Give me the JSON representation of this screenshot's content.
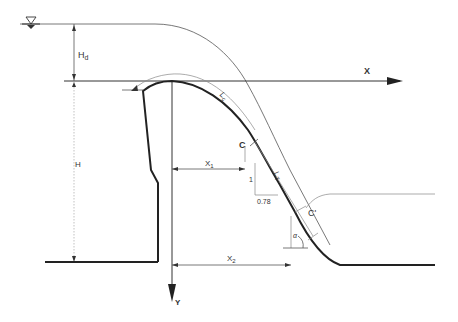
{
  "diagram": {
    "labels": {
      "x_axis": "X",
      "y_axis": "Y",
      "design_head": "H",
      "design_head_sub": "d",
      "dam_height": "H",
      "curved_length": "L",
      "curved_length_sub": "c",
      "straight_length": "L",
      "straight_length_sub": "T",
      "tangent_point": "C",
      "end_point": "C'",
      "x1": "X",
      "x1_sub": "1",
      "x2": "X",
      "x2_sub": "2",
      "slope_rise": "1",
      "slope_run": "0.78",
      "angle": "α"
    },
    "symbols": {
      "water_surface": "water-surface-triangle"
    },
    "colors": {
      "profile": "#222222",
      "lines": "#555555",
      "background": "#ffffff"
    }
  }
}
